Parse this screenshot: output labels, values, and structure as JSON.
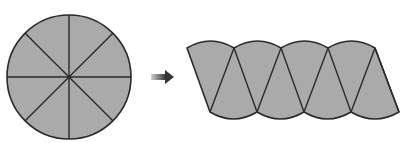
{
  "diagram": {
    "colors": {
      "fill": "#aaaaaa",
      "stroke": "#2a2a2a",
      "arrow_start": "#c8c8c8",
      "arrow_end": "#333333",
      "background": "#ffffff"
    },
    "circle": {
      "cx": 69,
      "cy": 77,
      "r": 62,
      "sectors": 8
    },
    "arrow": {
      "direction": "right",
      "x1": 151,
      "x2": 174,
      "y": 77
    },
    "parallelogram": {
      "sectors": 8,
      "top_vertices_x": [
        187,
        234,
        281,
        328,
        375
      ],
      "bottom_vertices_x": [
        210,
        257,
        304,
        351,
        399
      ],
      "top_y": 48,
      "bottom_y": 112
    }
  }
}
